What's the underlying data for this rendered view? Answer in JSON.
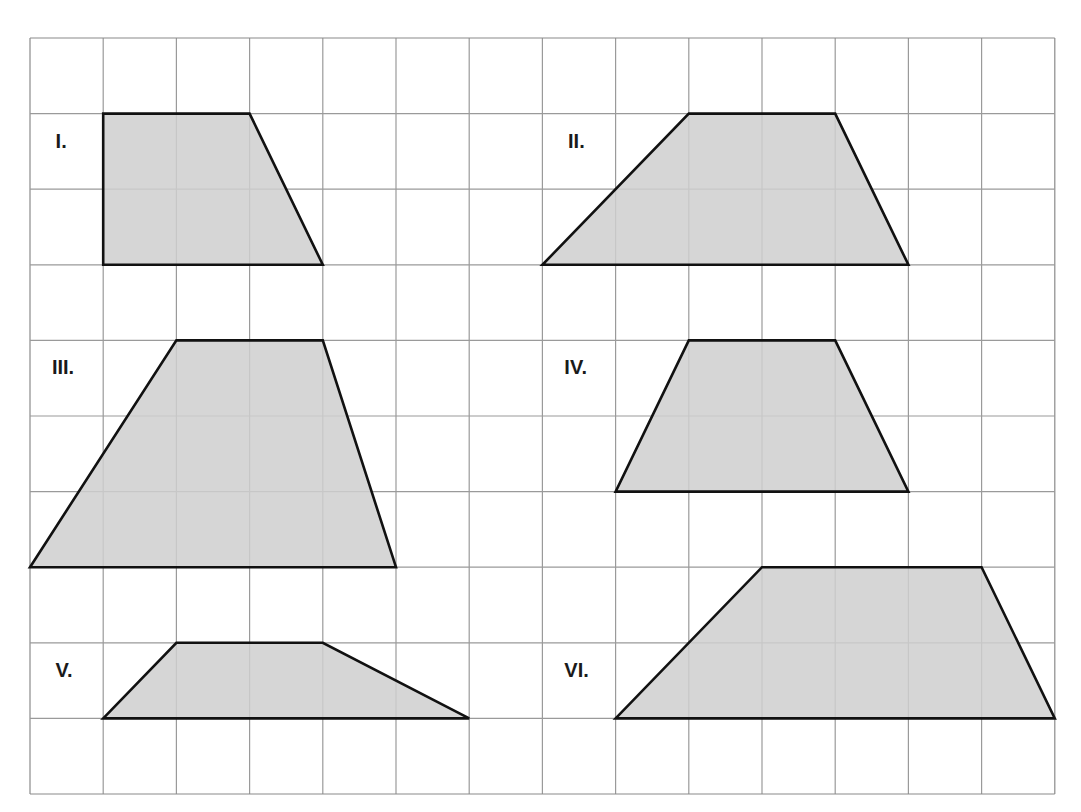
{
  "grid": {
    "columns": 14,
    "rows": 10,
    "origin_px": [
      30,
      38
    ],
    "cell_px": [
      73.2,
      75.6
    ],
    "line_color": "#9a9a9a",
    "border_color": "#8a8a8a"
  },
  "style": {
    "fill": "#cfcfcf",
    "stroke": "#111111",
    "label_color": "#1a1a1a"
  },
  "shapes": [
    {
      "label": "I.",
      "label_pos": [
        0.35,
        1.45
      ],
      "vertices": [
        [
          1,
          1
        ],
        [
          3,
          1
        ],
        [
          4,
          3
        ],
        [
          1,
          3
        ]
      ]
    },
    {
      "label": "II.",
      "label_pos": [
        7.35,
        1.45
      ],
      "vertices": [
        [
          9,
          1
        ],
        [
          11,
          1
        ],
        [
          12,
          3
        ],
        [
          7,
          3
        ]
      ]
    },
    {
      "label": "III.",
      "label_pos": [
        0.3,
        4.45
      ],
      "vertices": [
        [
          2,
          4
        ],
        [
          4,
          4
        ],
        [
          5,
          7
        ],
        [
          0,
          7
        ]
      ]
    },
    {
      "label": "IV.",
      "label_pos": [
        7.3,
        4.45
      ],
      "vertices": [
        [
          9,
          4
        ],
        [
          11,
          4
        ],
        [
          12,
          6
        ],
        [
          8,
          6
        ]
      ]
    },
    {
      "label": "V.",
      "label_pos": [
        0.35,
        8.45
      ],
      "vertices": [
        [
          2,
          8
        ],
        [
          4,
          8
        ],
        [
          6,
          9
        ],
        [
          1,
          9
        ]
      ]
    },
    {
      "label": "VI.",
      "label_pos": [
        7.3,
        8.45
      ],
      "vertices": [
        [
          10,
          7
        ],
        [
          13,
          7
        ],
        [
          14,
          9
        ],
        [
          8,
          9
        ]
      ]
    }
  ]
}
